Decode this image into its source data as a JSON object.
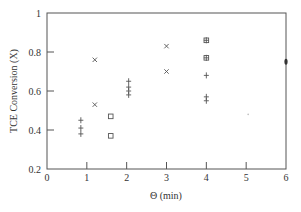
{
  "chart_data": {
    "type": "scatter",
    "title": "",
    "xlabel": "Θ (min)",
    "ylabel": "TCE Conversion (X)",
    "xlim": [
      0,
      6
    ],
    "ylim": [
      0.2,
      1.0
    ],
    "x_ticks": [
      "0",
      "1",
      "2",
      "3",
      "4",
      "5",
      "6"
    ],
    "y_ticks": [
      "0.2",
      "0.4",
      "0.6",
      "0.8",
      "1"
    ],
    "grid": false,
    "legend": null,
    "series": [
      {
        "name": "cross-markers",
        "marker": "x",
        "points": [
          [
            1.2,
            0.76
          ],
          [
            1.2,
            0.53
          ],
          [
            3.0,
            0.83
          ],
          [
            3.0,
            0.7
          ]
        ]
      },
      {
        "name": "plus-markers",
        "marker": "+",
        "points": [
          [
            0.85,
            0.45
          ],
          [
            0.85,
            0.41
          ],
          [
            0.85,
            0.38
          ],
          [
            2.05,
            0.65
          ],
          [
            2.05,
            0.62
          ],
          [
            2.05,
            0.6
          ],
          [
            2.05,
            0.58
          ],
          [
            4.0,
            0.86
          ],
          [
            4.0,
            0.77
          ],
          [
            4.0,
            0.68
          ],
          [
            4.0,
            0.57
          ],
          [
            4.0,
            0.55
          ]
        ]
      },
      {
        "name": "square-markers",
        "marker": "square",
        "points": [
          [
            1.6,
            0.47
          ],
          [
            1.6,
            0.37
          ],
          [
            4.0,
            0.86
          ],
          [
            4.0,
            0.77
          ]
        ]
      },
      {
        "name": "filled-markers",
        "marker": "dot",
        "points": [
          [
            6.0,
            0.75
          ],
          [
            5.05,
            0.48
          ]
        ]
      }
    ]
  },
  "plot": {
    "left_px": 47,
    "right_px": 286,
    "top_px": 13,
    "bottom_px": 169,
    "colors": {
      "axis": "#555555",
      "marker": "#555555",
      "text": "#333333"
    }
  }
}
